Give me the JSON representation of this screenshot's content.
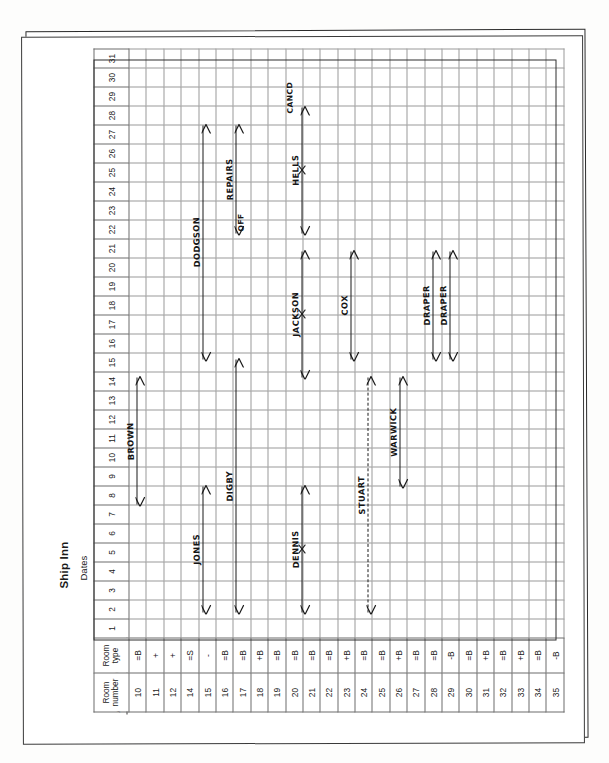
{
  "document": {
    "type": "hotel-booking-chart",
    "hotel_name": "Ship Inn",
    "dates_label": "Dates",
    "month_label": "August 19"
  },
  "table": {
    "headers": {
      "room_number": "Room number",
      "room_type": "Room type"
    },
    "day_columns": [
      "1",
      "2",
      "3",
      "4",
      "5",
      "6",
      "7",
      "8",
      "9",
      "10",
      "11",
      "12",
      "13",
      "14",
      "15",
      "16",
      "17",
      "18",
      "19",
      "20",
      "21",
      "22",
      "23",
      "24",
      "25",
      "26",
      "27",
      "28",
      "29",
      "30",
      "31"
    ],
    "rows": [
      {
        "room_number": "10",
        "room_type": "=B"
      },
      {
        "room_number": "11",
        "room_type": "+"
      },
      {
        "room_number": "12",
        "room_type": "+"
      },
      {
        "room_number": "14",
        "room_type": "=S"
      },
      {
        "room_number": "15",
        "room_type": "-"
      },
      {
        "room_number": "16",
        "room_type": "=B"
      },
      {
        "room_number": "17",
        "room_type": "=B"
      },
      {
        "room_number": "18",
        "room_type": "+B"
      },
      {
        "room_number": "19",
        "room_type": "=B"
      },
      {
        "room_number": "20",
        "room_type": "=B"
      },
      {
        "room_number": "21",
        "room_type": "=B"
      },
      {
        "room_number": "22",
        "room_type": "=B"
      },
      {
        "room_number": "23",
        "room_type": "+B"
      },
      {
        "room_number": "24",
        "room_type": "=B"
      },
      {
        "room_number": "25",
        "room_type": "=B"
      },
      {
        "room_number": "26",
        "room_type": "+B"
      },
      {
        "room_number": "27",
        "room_type": "=B"
      },
      {
        "room_number": "28",
        "room_type": "=B"
      },
      {
        "room_number": "29",
        "room_type": "-B"
      },
      {
        "room_number": "30",
        "room_type": "=B"
      },
      {
        "room_number": "31",
        "room_type": "+B"
      },
      {
        "room_number": "32",
        "room_type": "=B"
      },
      {
        "room_number": "33",
        "room_type": "+B"
      },
      {
        "room_number": "34",
        "room_type": "=B"
      },
      {
        "room_number": "35",
        "room_type": "-B"
      }
    ]
  },
  "bookings": [
    {
      "id": "brown",
      "guest": "BROWN",
      "room_number": "10",
      "start_day": 8,
      "end_day": 15,
      "style": "solid"
    },
    {
      "id": "jones",
      "guest": "JONES",
      "room_number": "15",
      "start_day": 2,
      "end_day": 9,
      "style": "solid"
    },
    {
      "id": "dodgson",
      "guest": "DODGSON",
      "room_number": "15",
      "start_day": 16,
      "end_day": 29,
      "style": "solid"
    },
    {
      "id": "digby",
      "guest": "DIGBY",
      "room_number": "17",
      "start_day": 2,
      "end_day": 16,
      "style": "solid"
    },
    {
      "id": "repairs",
      "guest": "REPAIRS",
      "room_number": "17",
      "start_day": 23,
      "end_day": 29,
      "style": "solid",
      "note": "OFF"
    },
    {
      "id": "dennis",
      "guest": "DENNIS",
      "room_number": "21",
      "start_day": 2,
      "end_day": 9,
      "style": "solid",
      "cancelled": true
    },
    {
      "id": "jackson",
      "guest": "JACKSON",
      "room_number": "21",
      "start_day": 15,
      "end_day": 22,
      "style": "solid",
      "cancelled": true
    },
    {
      "id": "hells",
      "guest": "HELLS",
      "room_number": "21",
      "start_day": 23,
      "end_day": 30,
      "style": "solid",
      "cancelled": true
    },
    {
      "id": "stuart",
      "guest": "STUART",
      "room_number": "25",
      "start_day": 2,
      "end_day": 15,
      "style": "dashed"
    },
    {
      "id": "cox",
      "guest": "COX",
      "room_number": "24",
      "start_day": 16,
      "end_day": 22,
      "style": "solid"
    },
    {
      "id": "warwick",
      "guest": "WARWICK",
      "room_number": "27",
      "start_day": 9,
      "end_day": 15,
      "style": "solid"
    },
    {
      "id": "draper-1",
      "guest": "DRAPER",
      "room_number": "29",
      "start_day": 16,
      "end_day": 22,
      "style": "solid"
    },
    {
      "id": "draper-2",
      "guest": "DRAPER",
      "room_number": "30",
      "start_day": 16,
      "end_day": 22,
      "style": "solid"
    }
  ],
  "annotations": {
    "off_marker": "OFF",
    "cancel_marker": "X",
    "cancelled_tag": "CANCD"
  }
}
